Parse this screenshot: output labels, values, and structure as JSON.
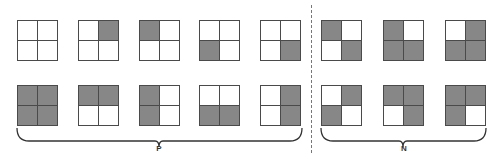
{
  "groups": [
    {
      "label": "P",
      "brace": {
        "x1": 17,
        "x2": 302,
        "tip": 159
      },
      "label_x": 159
    },
    {
      "label": "N",
      "brace": {
        "x1": 321,
        "x2": 486,
        "tip": 403
      },
      "label_x": 404
    }
  ],
  "cell_order": [
    "top-left",
    "top-right",
    "bottom-left",
    "bottom-right"
  ],
  "colors": {
    "filled": "#878787",
    "empty": "#ffffff",
    "border": "#4a4a4a"
  },
  "grids": [
    {
      "group": "P",
      "row": 1,
      "x": 17,
      "y": 20,
      "cells": [
        0,
        0,
        0,
        0
      ]
    },
    {
      "group": "P",
      "row": 1,
      "x": 78,
      "y": 20,
      "cells": [
        0,
        1,
        0,
        0
      ]
    },
    {
      "group": "P",
      "row": 1,
      "x": 139,
      "y": 20,
      "cells": [
        1,
        0,
        0,
        0
      ]
    },
    {
      "group": "P",
      "row": 1,
      "x": 199,
      "y": 20,
      "cells": [
        0,
        0,
        1,
        0
      ]
    },
    {
      "group": "P",
      "row": 1,
      "x": 260,
      "y": 20,
      "cells": [
        0,
        0,
        0,
        1
      ]
    },
    {
      "group": "N",
      "row": 1,
      "x": 321,
      "y": 20,
      "cells": [
        1,
        0,
        0,
        1
      ]
    },
    {
      "group": "N",
      "row": 1,
      "x": 383,
      "y": 20,
      "cells": [
        1,
        0,
        1,
        1
      ]
    },
    {
      "group": "N",
      "row": 1,
      "x": 445,
      "y": 20,
      "cells": [
        0,
        1,
        1,
        1
      ]
    },
    {
      "group": "P",
      "row": 2,
      "x": 17,
      "y": 85,
      "cells": [
        1,
        1,
        1,
        1
      ]
    },
    {
      "group": "P",
      "row": 2,
      "x": 78,
      "y": 85,
      "cells": [
        1,
        1,
        0,
        0
      ]
    },
    {
      "group": "P",
      "row": 2,
      "x": 139,
      "y": 85,
      "cells": [
        1,
        0,
        1,
        0
      ]
    },
    {
      "group": "P",
      "row": 2,
      "x": 199,
      "y": 85,
      "cells": [
        0,
        0,
        1,
        1
      ]
    },
    {
      "group": "P",
      "row": 2,
      "x": 260,
      "y": 85,
      "cells": [
        0,
        1,
        0,
        1
      ]
    },
    {
      "group": "N",
      "row": 2,
      "x": 321,
      "y": 85,
      "cells": [
        0,
        1,
        1,
        0
      ]
    },
    {
      "group": "N",
      "row": 2,
      "x": 383,
      "y": 85,
      "cells": [
        1,
        1,
        0,
        1
      ]
    },
    {
      "group": "N",
      "row": 2,
      "x": 445,
      "y": 85,
      "cells": [
        1,
        1,
        1,
        0
      ]
    }
  ]
}
